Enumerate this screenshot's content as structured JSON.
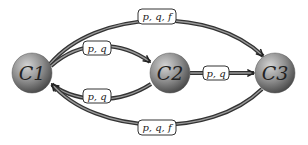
{
  "diagram": {
    "type": "state-transition",
    "nodes": [
      {
        "id": "C1",
        "label": "C1",
        "cx": 32,
        "cy": 73,
        "r": 20
      },
      {
        "id": "C2",
        "label": "C2",
        "cx": 170,
        "cy": 73,
        "r": 20
      },
      {
        "id": "C3",
        "label": "C3",
        "cx": 275,
        "cy": 73,
        "r": 20
      }
    ],
    "edges": [
      {
        "from": "C1",
        "to": "C3",
        "label": "p, q, f",
        "route": "top-arc"
      },
      {
        "from": "C1",
        "to": "C2",
        "label": "p, q",
        "route": "upper-arc"
      },
      {
        "from": "C2",
        "to": "C1",
        "label": "p, q",
        "route": "lower-arc"
      },
      {
        "from": "C2",
        "to": "C3",
        "label": "p, q",
        "route": "straight"
      },
      {
        "from": "C3",
        "to": "C1",
        "label": "p, q, f",
        "route": "bottom-arc"
      }
    ],
    "colors": {
      "node_fill_light": "#c8c8c8",
      "node_fill_dark": "#5a5a5a",
      "edge_stroke": "#3a3a3a",
      "label_border": "#333333"
    }
  }
}
